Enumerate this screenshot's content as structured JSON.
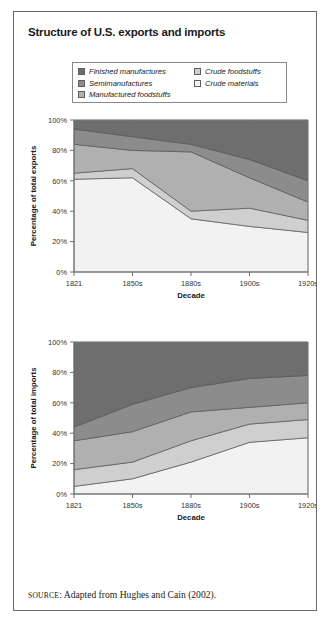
{
  "figure": {
    "title": "Structure of U.S. exports and imports",
    "source_prefix": "SOURCE",
    "source_text": ": Adapted from Hughes and Cain (2002)."
  },
  "legend": {
    "items": [
      {
        "label": "Finished manufactures",
        "color": "#6e6e6e",
        "column": "left"
      },
      {
        "label": "Semimanufactures",
        "color": "#8c8c8c",
        "column": "left"
      },
      {
        "label": "Manufactured foodstuffs",
        "color": "#b0b0b0",
        "column": "left"
      },
      {
        "label": "Crude foodstuffs",
        "color": "#cfcfcf",
        "column": "right"
      },
      {
        "label": "Crude materials",
        "color": "#f2f2f2",
        "column": "right"
      }
    ]
  },
  "chart_data": [
    {
      "type": "area",
      "name": "exports",
      "title": "",
      "xlabel": "Decade",
      "ylabel": "Percentage of total exports",
      "categories": [
        "1821",
        "1850s",
        "1880s",
        "1900s",
        "1920s"
      ],
      "ylim": [
        0,
        100
      ],
      "ytick_labels": [
        "0%",
        "20%",
        "40%",
        "60%",
        "80%",
        "100%"
      ],
      "yticks": [
        0,
        20,
        40,
        60,
        80,
        100
      ],
      "grid": false,
      "stacked": true,
      "stack_order_bottom_to_top": [
        "Crude materials",
        "Crude foodstuffs",
        "Manufactured foodstuffs",
        "Semimanufactures",
        "Finished manufactures"
      ],
      "series": [
        {
          "name": "Crude materials",
          "color": "#f2f2f2",
          "values": [
            61,
            62,
            35,
            30,
            26
          ]
        },
        {
          "name": "Crude foodstuffs",
          "color": "#cfcfcf",
          "values": [
            4,
            6,
            5,
            12,
            8
          ]
        },
        {
          "name": "Manufactured foodstuffs",
          "color": "#b0b0b0",
          "values": [
            19,
            12,
            39,
            20,
            12
          ]
        },
        {
          "name": "Semimanufactures",
          "color": "#8c8c8c",
          "values": [
            10,
            9,
            5,
            12,
            14
          ]
        },
        {
          "name": "Finished manufactures",
          "color": "#6e6e6e",
          "values": [
            6,
            11,
            16,
            26,
            40
          ]
        }
      ],
      "cumulative_boundaries": [
        {
          "name": "Crude materials top",
          "values": [
            61,
            62,
            35,
            30,
            26
          ]
        },
        {
          "name": "Crude foodstuffs top",
          "values": [
            65,
            68,
            40,
            42,
            34
          ]
        },
        {
          "name": "Manufactured foodstuffs top",
          "values": [
            84,
            80,
            79,
            62,
            46
          ]
        },
        {
          "name": "Semimanufactures top",
          "values": [
            94,
            89,
            84,
            74,
            60
          ]
        },
        {
          "name": "Finished manufactures top",
          "values": [
            100,
            100,
            100,
            100,
            100
          ]
        }
      ]
    },
    {
      "type": "area",
      "name": "imports",
      "title": "",
      "xlabel": "Decade",
      "ylabel": "Percentage of total imports",
      "categories": [
        "1821",
        "1850s",
        "1880s",
        "1900s",
        "1920s"
      ],
      "ylim": [
        0,
        100
      ],
      "ytick_labels": [
        "0%",
        "20%",
        "40%",
        "60%",
        "80%",
        "100%"
      ],
      "yticks": [
        0,
        20,
        40,
        60,
        80,
        100
      ],
      "grid": false,
      "stacked": true,
      "stack_order_bottom_to_top": [
        "Crude materials",
        "Crude foodstuffs",
        "Manufactured foodstuffs",
        "Semimanufactures",
        "Finished manufactures"
      ],
      "series": [
        {
          "name": "Crude materials",
          "color": "#f2f2f2",
          "values": [
            5,
            10,
            21,
            34,
            37
          ]
        },
        {
          "name": "Crude foodstuffs",
          "color": "#cfcfcf",
          "values": [
            11,
            11,
            14,
            12,
            12
          ]
        },
        {
          "name": "Manufactured foodstuffs",
          "color": "#b0b0b0",
          "values": [
            19,
            20,
            19,
            11,
            11
          ]
        },
        {
          "name": "Semimanufactures",
          "color": "#8c8c8c",
          "values": [
            9,
            18,
            16,
            19,
            18
          ]
        },
        {
          "name": "Finished manufactures",
          "color": "#6e6e6e",
          "values": [
            56,
            41,
            30,
            24,
            22
          ]
        }
      ],
      "cumulative_boundaries": [
        {
          "name": "Crude materials top",
          "values": [
            5,
            10,
            21,
            34,
            37
          ]
        },
        {
          "name": "Crude foodstuffs top",
          "values": [
            16,
            21,
            35,
            46,
            49
          ]
        },
        {
          "name": "Manufactured foodstuffs top",
          "values": [
            35,
            41,
            54,
            57,
            60
          ]
        },
        {
          "name": "Semimanufactures top",
          "values": [
            44,
            59,
            70,
            76,
            78
          ]
        },
        {
          "name": "Finished manufactures top",
          "values": [
            100,
            100,
            100,
            100,
            100
          ]
        }
      ]
    }
  ]
}
